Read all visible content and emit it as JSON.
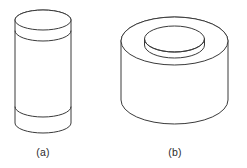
{
  "figure": {
    "kind": "line-drawing",
    "background_color": "#ffffff",
    "stroke_color": "#3a3a3a",
    "fill_color": "#ffffff",
    "caption_color": "#2b2b2b",
    "panels": [
      {
        "id": "panel-a",
        "label": "(a)",
        "object_name": "tall-cylinder",
        "description": "Tall upright cylinder with two horizontal band seams",
        "geometry": {
          "left": 15,
          "right": 71,
          "top": 10,
          "bottom": 133,
          "width": 56,
          "height": 123,
          "center_x": 43,
          "ellipse_rx": 28,
          "ellipse_ry": 10,
          "top_ellipse_cy": 20,
          "band_upper_cy": 31,
          "band_lower_cy": 107,
          "bottom_arc_cy": 123
        },
        "label_position": {
          "x": 43,
          "y": 156
        }
      },
      {
        "id": "panel-b",
        "label": "(b)",
        "object_name": "hollow-cylinder-ring",
        "description": "Short wide hollow cylinder (tube) with circular bore seen from above",
        "geometry": {
          "left": 121,
          "right": 228,
          "top": 17,
          "bottom": 124,
          "width": 107,
          "height": 107,
          "center_x": 174.5,
          "outer_rx": 53.5,
          "outer_ry": 24,
          "outer_top_cy": 41,
          "bottom_arc_cy": 100,
          "inner_rx": 30,
          "inner_ry": 13,
          "inner_top_cy": 39,
          "inner_bottom_offset": 6
        },
        "label_position": {
          "x": 175,
          "y": 156
        }
      }
    ]
  }
}
